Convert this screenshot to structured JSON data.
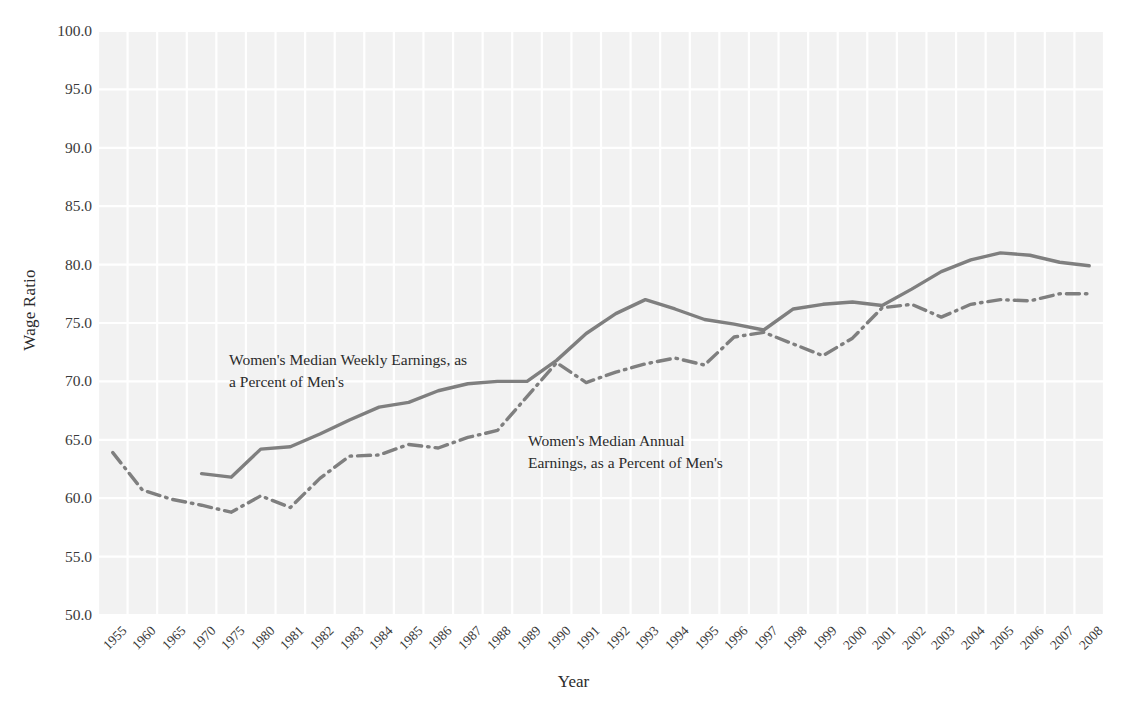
{
  "chart_data": {
    "type": "line",
    "title": "",
    "subtitle": "",
    "xlabel": "Year",
    "ylabel": "Wage Ratio",
    "ylim": [
      50.0,
      100.0
    ],
    "ytick_labels": [
      "100.0",
      "95.0",
      "90.0",
      "85.0",
      "80.0",
      "75.0",
      "70.0",
      "65.0",
      "60.0",
      "55.0",
      "50.0"
    ],
    "ytick_values": [
      100.0,
      95.0,
      90.0,
      85.0,
      80.0,
      75.0,
      70.0,
      65.0,
      60.0,
      55.0,
      50.0
    ],
    "grid": true,
    "grid_color": "#ffffff",
    "plot_background": "#f2f2f2",
    "legend_position": "inline-annotations",
    "categories": [
      "1955",
      "1960",
      "1965",
      "1970",
      "1975",
      "1980",
      "1981",
      "1982",
      "1983",
      "1984",
      "1985",
      "1986",
      "1987",
      "1988",
      "1989",
      "1990",
      "1991",
      "1992",
      "1993",
      "1994",
      "1995",
      "1996",
      "1997",
      "1998",
      "1999",
      "2000",
      "2001",
      "2002",
      "2003",
      "2004",
      "2005",
      "2006",
      "2007",
      "2008"
    ],
    "series": [
      {
        "name": "Women's Median Weekly Earnings, as a Percent of Men's",
        "style": "solid",
        "color": "#7f7f7f",
        "annotation": "Women's Median Weekly Earnings, as\na Percent of Men's",
        "values": [
          null,
          null,
          null,
          62.1,
          61.8,
          64.2,
          64.4,
          65.5,
          66.7,
          67.8,
          68.2,
          69.2,
          69.8,
          70.0,
          70.0,
          71.8,
          74.1,
          75.8,
          77.0,
          76.2,
          75.3,
          74.9,
          74.4,
          76.2,
          76.6,
          76.8,
          76.5,
          77.9,
          79.4,
          80.4,
          81.0,
          80.8,
          80.2,
          79.9
        ]
      },
      {
        "name": "Women's Median Annual Earnings, as a Percent of Men's",
        "style": "dashdot",
        "color": "#7f7f7f",
        "annotation": "Women's Median Annual\nEarnings, as a Percent of Men's",
        "values": [
          63.9,
          60.7,
          59.9,
          59.4,
          58.8,
          60.2,
          59.2,
          61.7,
          63.6,
          63.7,
          64.6,
          64.3,
          65.2,
          65.8,
          68.7,
          71.6,
          69.9,
          70.8,
          71.5,
          72.0,
          71.4,
          73.8,
          74.2,
          73.2,
          72.2,
          73.7,
          76.3,
          76.6,
          75.5,
          76.6,
          77.0,
          76.9,
          77.5,
          77.5
        ]
      }
    ],
    "annotations": [
      {
        "id": "weekly",
        "text": "Women's Median Weekly Earnings, as\na Percent of Men's"
      },
      {
        "id": "annual",
        "text": "Women's Median Annual\nEarnings, as a Percent of Men's"
      }
    ]
  }
}
